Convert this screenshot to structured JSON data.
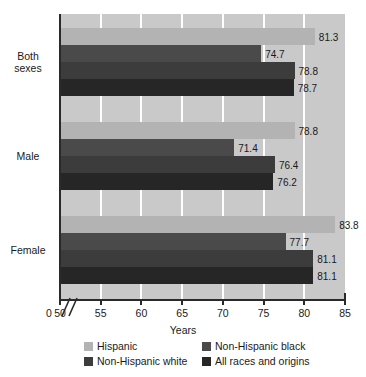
{
  "chart_data": {
    "type": "bar",
    "orientation": "horizontal",
    "title": "",
    "xlabel": "Years",
    "ylabel": "",
    "xlim": [
      50,
      85
    ],
    "xticks": [
      50,
      55,
      60,
      65,
      70,
      75,
      80,
      85
    ],
    "xtick_labels": [
      "50",
      "55",
      "60",
      "65",
      "70",
      "75",
      "80",
      "85"
    ],
    "zero_tick_label": "0",
    "axis_break": true,
    "grid": "vertical-white",
    "legend_position": "bottom",
    "categories": [
      "Both sexes",
      "Male",
      "Female"
    ],
    "category_label_lines": [
      [
        "Both",
        "sexes"
      ],
      [
        "Male"
      ],
      [
        "Female"
      ]
    ],
    "series": [
      {
        "name": "Hispanic",
        "color": "#b3b3b3",
        "values": [
          81.3,
          78.8,
          83.8
        ],
        "labels": [
          "81.3",
          "78.8",
          "83.8"
        ]
      },
      {
        "name": "Non-Hispanic black",
        "color": "#4a4a4a",
        "values": [
          74.7,
          71.4,
          77.7
        ],
        "labels": [
          "74.7",
          "71.4",
          "77.7"
        ]
      },
      {
        "name": "Non-Hispanic white",
        "color": "#3c3c3c",
        "values": [
          78.8,
          76.4,
          81.1
        ],
        "labels": [
          "78.8",
          "76.4",
          "81.1"
        ]
      },
      {
        "name": "All races and origins",
        "color": "#262626",
        "values": [
          78.7,
          76.2,
          81.1
        ],
        "labels": [
          "78.7",
          "76.2",
          "81.1"
        ]
      }
    ],
    "legend_entries": [
      {
        "label": "Hispanic",
        "color": "#b3b3b3"
      },
      {
        "label": "Non-Hispanic black",
        "color": "#4a4a4a"
      },
      {
        "label": "Non-Hispanic white",
        "color": "#3c3c3c"
      },
      {
        "label": "All races and origins",
        "color": "#262626"
      }
    ],
    "plot_background": "#c9c9c9",
    "gridline_color": "#ffffff",
    "axis_color": "#2a2a2a"
  }
}
